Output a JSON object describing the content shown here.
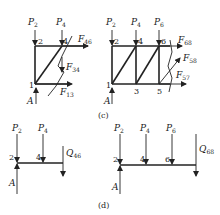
{
  "diagram": {
    "panels": [
      {
        "id": "b",
        "caption": "",
        "loads": [
          {
            "sym": "P",
            "sub": "2"
          },
          {
            "sym": "P",
            "sub": "4"
          }
        ],
        "nodes": [
          "1",
          "2",
          "4"
        ],
        "forces": [
          {
            "sym": "F",
            "sub": "46"
          },
          {
            "sym": "F",
            "sub": "34"
          },
          {
            "sym": "F",
            "sub": "13"
          }
        ],
        "support": "A"
      },
      {
        "id": "c",
        "caption": "(c)",
        "loads": [
          {
            "sym": "P",
            "sub": "2"
          },
          {
            "sym": "P",
            "sub": "4"
          },
          {
            "sym": "P",
            "sub": "6"
          }
        ],
        "nodes": [
          "1",
          "2",
          "3",
          "4",
          "5",
          "6"
        ],
        "forces": [
          {
            "sym": "F",
            "sub": "68"
          },
          {
            "sym": "F",
            "sub": "58"
          },
          {
            "sym": "F",
            "sub": "57"
          }
        ],
        "support": "A"
      },
      {
        "id": "d-left",
        "caption": "",
        "loads": [
          {
            "sym": "P",
            "sub": "2"
          },
          {
            "sym": "P",
            "sub": "4"
          }
        ],
        "nodes": [
          "2",
          "4"
        ],
        "forces": [
          {
            "sym": "Q",
            "sub": "46"
          }
        ],
        "support": "A"
      },
      {
        "id": "d-right",
        "caption": "(d)",
        "loads": [
          {
            "sym": "P",
            "sub": "2"
          },
          {
            "sym": "P",
            "sub": "4"
          },
          {
            "sym": "P",
            "sub": "6"
          }
        ],
        "nodes": [
          "2",
          "4",
          "6"
        ],
        "forces": [
          {
            "sym": "Q",
            "sub": "68"
          }
        ],
        "support": "A"
      }
    ]
  }
}
